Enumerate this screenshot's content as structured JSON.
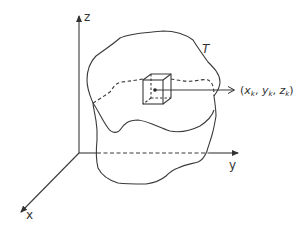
{
  "diagram": {
    "title": "",
    "axes": {
      "z": {
        "label": "z"
      },
      "y": {
        "label": "y"
      },
      "x": {
        "label": "x"
      }
    },
    "region": {
      "label": "T"
    },
    "point": {
      "label_open": "(",
      "x_sym": "x",
      "y_sym": "y",
      "z_sym": "z",
      "subscript": "k",
      "sep": ", ",
      "label_close": ")"
    },
    "colors": {
      "stroke": "#3a3a3a",
      "text": "#333333",
      "background": "#ffffff"
    }
  }
}
